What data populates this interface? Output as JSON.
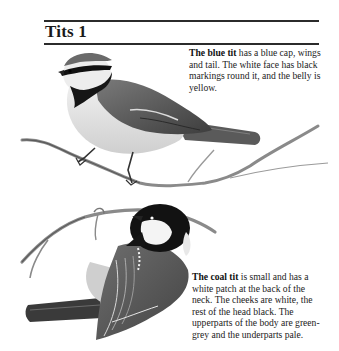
{
  "page": {
    "title": "Tits 1"
  },
  "entries": [
    {
      "name": "The blue tit",
      "description": " has a blue cap, wings and tail. The white face has black markings round it, and the belly is yellow."
    },
    {
      "name": "The coal tit",
      "description": " is small and has a white patch at the back of the neck. The cheeks are white, the rest of the head black. The upperparts of the body are green-grey and the underparts pale."
    }
  ],
  "illustrations": [
    {
      "subject": "blue-tit",
      "pose": "perched on twig, facing left"
    },
    {
      "subject": "coal-tit",
      "pose": "perched on curved branch, seen from behind, head turned left"
    }
  ]
}
